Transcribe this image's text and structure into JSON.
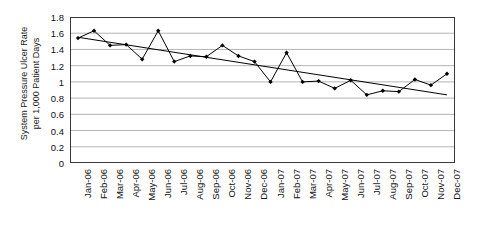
{
  "chart_data": {
    "type": "line",
    "title": "",
    "xlabel": "",
    "ylabel": "System Pressure Ulcer Rate per 1,000 Patient Days",
    "ylabel_lines": [
      "System Pressure Ulcer Rate",
      "per 1,000 Patient Days"
    ],
    "categories": [
      "Jan-06",
      "Feb-06",
      "Mar-06",
      "Apr-06",
      "May-06",
      "Jun-06",
      "Jul-06",
      "Aug-06",
      "Sep-06",
      "Oct-06",
      "Nov-06",
      "Dec-06",
      "Jan-07",
      "Feb-07",
      "Mar-07",
      "Apr-07",
      "May-07",
      "Jun-07",
      "Jul-07",
      "Aug-07",
      "Sep-07",
      "Oct-07",
      "Nov-07",
      "Dec-07"
    ],
    "yticks": [
      0,
      0.2,
      0.4,
      0.6,
      0.8,
      1,
      1.2,
      1.4,
      1.6,
      1.8
    ],
    "ytick_labels": [
      "0",
      "0.2",
      "0.4",
      "0.6",
      "0.8",
      "1",
      "1.2",
      "1.4",
      "1.6",
      "1.8"
    ],
    "ylim": [
      0,
      1.8
    ],
    "grid": true,
    "legend": "none",
    "series": [
      {
        "name": "System Pressure Ulcer Rate",
        "type": "line",
        "marker": "diamond",
        "color": "#000000",
        "values": [
          1.54,
          1.63,
          1.45,
          1.46,
          1.28,
          1.63,
          1.25,
          1.32,
          1.31,
          1.45,
          1.32,
          1.25,
          1.0,
          1.36,
          1.0,
          1.01,
          0.92,
          1.02,
          0.84,
          0.89,
          0.88,
          1.03,
          0.96,
          1.1
        ]
      },
      {
        "name": "Linear trend",
        "type": "trendline",
        "color": "#000000",
        "start_value": 1.55,
        "end_value": 0.84
      }
    ]
  }
}
